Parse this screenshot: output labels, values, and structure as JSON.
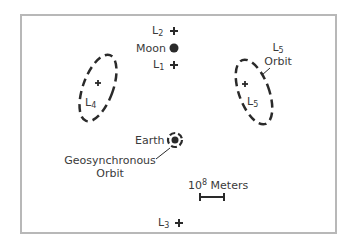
{
  "diagram": {
    "labels": {
      "l2": {
        "base": "L",
        "sub": "2"
      },
      "moon": "Moon",
      "l1": {
        "base": "L",
        "sub": "1"
      },
      "l4": {
        "base": "L",
        "sub": "4"
      },
      "l5": {
        "base": "L",
        "sub": "5"
      },
      "l5_orbit": {
        "base": "L",
        "sub": "5",
        "line2": "Orbit"
      },
      "earth": "Earth",
      "geo_orbit": {
        "line1": "Geosynchronous",
        "line2": "Orbit"
      },
      "scale": {
        "base": "10",
        "sup": "8",
        "unit": " Meters"
      },
      "l3": {
        "base": "L",
        "sub": "3"
      }
    },
    "colors": {
      "ink": "#2a2a2a",
      "frame": "#b8b8b8",
      "background": "#ffffff"
    }
  }
}
